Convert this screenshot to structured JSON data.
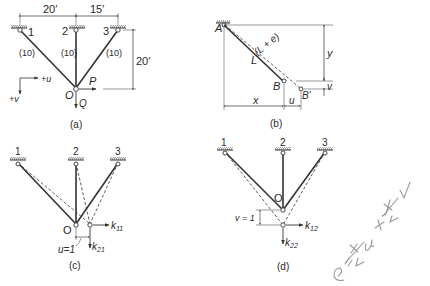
{
  "panel_a": {
    "caption": "(a)",
    "dim_left": "20′",
    "dim_right": "15′",
    "dim_height": "20′",
    "nodes": [
      "1",
      "2",
      "3"
    ],
    "joint": "O",
    "member_areas": [
      "(10)",
      "(10)",
      "(10)"
    ],
    "load_horizontal": "P",
    "load_vertical": "Q",
    "axis_u": "+u",
    "axis_v": "+v"
  },
  "panel_b": {
    "caption": "(b)",
    "point_a": "A",
    "point_b": "B",
    "point_b_prime": "B′",
    "length": "L",
    "elongated_length": "(L + e)",
    "dim_x": "x",
    "dim_y": "y",
    "dim_u": "u",
    "dim_v": "v"
  },
  "panel_c": {
    "caption": "(c)",
    "nodes": [
      "1",
      "2",
      "3"
    ],
    "joint": "O",
    "displacement": "u=1",
    "force_h": "k",
    "force_h_sub": "11",
    "force_v": "k",
    "force_v_sub": "21"
  },
  "panel_d": {
    "caption": "(d)",
    "nodes": [
      "1",
      "2",
      "3"
    ],
    "joint": "O",
    "displacement": "v = 1",
    "force_h": "k",
    "force_h_sub": "12",
    "force_v": "k",
    "force_v_sub": "22"
  },
  "handwritten_note": "e = x/L u + y/L v"
}
